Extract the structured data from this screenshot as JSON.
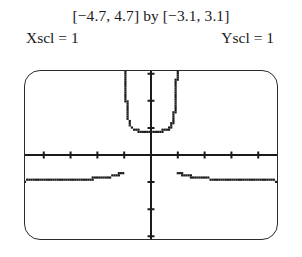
{
  "caption": {
    "window_line": "[−4.7, 4.7] by [−3.1, 3.1]",
    "xscl_label": "Xscl = 1",
    "yscl_label": "Yscl = 1"
  },
  "screen": {
    "border_color": "#2b2b2b",
    "background_color": "#ffffff",
    "curve_color": "#1a1a1a",
    "axis_color": "#1a1a1a"
  },
  "chart_data": {
    "type": "line",
    "title": "[−4.7, 4.7] by [−3.1, 3.1]",
    "xlabel": "",
    "ylabel": "",
    "xlim": [
      -4.7,
      4.7
    ],
    "ylim": [
      -3.1,
      3.1
    ],
    "xscl": 1,
    "yscl": 1,
    "grid": false,
    "legend": "none",
    "axes": {
      "x_ticks": [
        -4,
        -3,
        -2,
        -1,
        1,
        2,
        3,
        4
      ],
      "y_ticks": [
        -3,
        -2,
        -1,
        1,
        2,
        3
      ],
      "x_axis_y": 0,
      "y_axis_x": 0
    },
    "annotations": {
      "vertical_asymptotes": [
        -1,
        1
      ],
      "horizontal_asymptote": -1,
      "render_style": "pixelated-dotted"
    },
    "series": [
      {
        "name": "left-branch",
        "x": [
          -4.7,
          -4.5,
          -4.3,
          -4.1,
          -3.9,
          -3.7,
          -3.5,
          -3.3,
          -3.1,
          -2.9,
          -2.7,
          -2.5,
          -2.3,
          -2.1,
          -1.95,
          -1.8,
          -1.7,
          -1.6,
          -1.5,
          -1.42,
          -1.34,
          -1.28,
          -1.22,
          -1.17,
          -1.13,
          -1.1,
          -1.07,
          -1.05,
          -1.03,
          -1.015
        ],
        "y": [
          -0.9527,
          -0.9505,
          -0.9479,
          -0.9449,
          -0.9415,
          -0.9375,
          -0.9328,
          -0.9274,
          -0.9211,
          -0.9137,
          -0.905,
          -0.8948,
          -0.8827,
          -0.8681,
          -0.855,
          -0.8389,
          -0.8264,
          -0.8117,
          -0.7943,
          -0.7783,
          -0.7594,
          -0.7424,
          -0.7228,
          -0.7045,
          -0.6878,
          -0.6746,
          -0.6607,
          -0.6508,
          -0.6404,
          -0.6324
        ]
      },
      {
        "name": "center-branch",
        "x": [
          -0.985,
          -0.97,
          -0.95,
          -0.93,
          -0.9,
          -0.86,
          -0.82,
          -0.78,
          -0.72,
          -0.66,
          -0.58,
          -0.5,
          -0.4,
          -0.3,
          -0.2,
          -0.1,
          0.0,
          0.1,
          0.2,
          0.3,
          0.4,
          0.5,
          0.58,
          0.66,
          0.72,
          0.78,
          0.82,
          0.86,
          0.9,
          0.93,
          0.95,
          0.97,
          0.985
        ],
        "y": [
          3.1,
          3.0,
          2.6,
          2.2,
          1.8,
          1.45,
          1.25,
          1.12,
          1.02,
          0.96,
          0.92,
          0.9,
          0.89,
          0.885,
          0.88,
          0.88,
          0.88,
          0.88,
          0.88,
          0.885,
          0.89,
          0.9,
          0.92,
          0.96,
          1.02,
          1.12,
          1.25,
          1.45,
          1.8,
          2.2,
          2.6,
          3.0,
          3.1
        ]
      },
      {
        "name": "right-branch",
        "x": [
          1.015,
          1.03,
          1.05,
          1.07,
          1.1,
          1.13,
          1.17,
          1.22,
          1.28,
          1.34,
          1.42,
          1.5,
          1.6,
          1.7,
          1.8,
          1.95,
          2.1,
          2.3,
          2.5,
          2.7,
          2.9,
          3.1,
          3.3,
          3.5,
          3.7,
          3.9,
          4.1,
          4.3,
          4.5,
          4.7
        ],
        "y": [
          -0.6324,
          -0.6404,
          -0.6508,
          -0.6607,
          -0.6746,
          -0.6878,
          -0.7045,
          -0.7228,
          -0.7424,
          -0.7594,
          -0.7783,
          -0.7943,
          -0.8117,
          -0.8264,
          -0.8389,
          -0.855,
          -0.8681,
          -0.8827,
          -0.8948,
          -0.905,
          -0.9137,
          -0.9211,
          -0.9274,
          -0.9328,
          -0.9375,
          -0.9415,
          -0.9449,
          -0.9479,
          -0.9505,
          -0.9527
        ]
      }
    ]
  }
}
